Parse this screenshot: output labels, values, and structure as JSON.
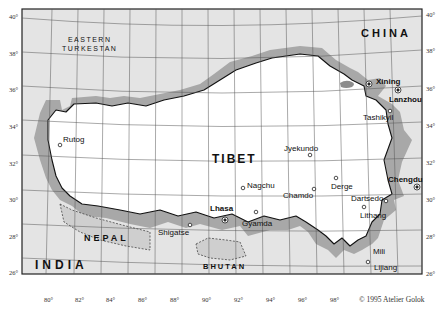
{
  "map": {
    "regions": {
      "tibet": "TIBET",
      "china": "CHINA",
      "eastern_turkestan_1": "EASTERN",
      "eastern_turkestan_2": "TURKESTAN",
      "nepal": "NEPAL",
      "india": "INDIA",
      "bhutan": "BHUTAN"
    },
    "cities": [
      {
        "name": "Xining",
        "type": "major"
      },
      {
        "name": "Lanzhou",
        "type": "major"
      },
      {
        "name": "Tashikyil",
        "type": "minor"
      },
      {
        "name": "Rutog",
        "type": "minor"
      },
      {
        "name": "Jyekundo",
        "type": "minor"
      },
      {
        "name": "Chengdu",
        "type": "major"
      },
      {
        "name": "Nagchu",
        "type": "minor"
      },
      {
        "name": "Chamdo",
        "type": "minor"
      },
      {
        "name": "Derge",
        "type": "minor"
      },
      {
        "name": "Dartsedo",
        "type": "minor"
      },
      {
        "name": "Lhasa",
        "type": "major"
      },
      {
        "name": "Gyamda",
        "type": "minor"
      },
      {
        "name": "Shigatse",
        "type": "minor"
      },
      {
        "name": "Lithang",
        "type": "minor"
      },
      {
        "name": "Mili",
        "type": "minor"
      },
      {
        "name": "Lijiang",
        "type": "minor"
      }
    ],
    "lat_ticks_left": [
      "40°",
      "38°",
      "36°",
      "34°",
      "32°",
      "30°",
      "28°",
      "26°"
    ],
    "lat_ticks_right": [
      "40°",
      "38°",
      "36°",
      "34°",
      "32°",
      "30°",
      "28°",
      "26°"
    ],
    "lon_ticks": [
      "80°",
      "82°",
      "84°",
      "86°",
      "88°",
      "90°",
      "92°",
      "94°",
      "96°",
      "98°"
    ],
    "copyright": "© 1995  Atelier Golok",
    "colors": {
      "tibet_fill": "#ffffff",
      "outside_fill": "#e4e4e4",
      "border_shade": "#9a9a9a",
      "grid": "#555555",
      "frame": "#222222"
    }
  }
}
